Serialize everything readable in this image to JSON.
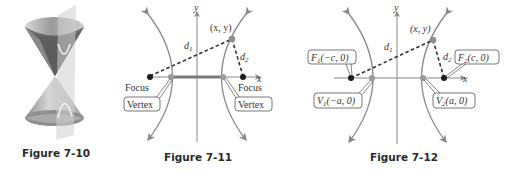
{
  "figures": [
    {
      "caption": "Figure 7-10",
      "description": "Double cone intersected by a vertical plane producing a hyperbola"
    },
    {
      "caption": "Figure 7-11",
      "labels": {
        "y_axis": "y",
        "x_axis": "x",
        "point": "(x, y)",
        "d1": "d",
        "d1_sub": "1",
        "d2": "d",
        "d2_sub": "2",
        "focus_left": "Focus",
        "focus_right": "Focus",
        "vertex_left": "Vertex",
        "vertex_right": "Vertex"
      }
    },
    {
      "caption": "Figure 7-12",
      "labels": {
        "y_axis": "y",
        "x_axis": "x",
        "point": "(x, y)",
        "d1": "d",
        "d1_sub": "1",
        "d2": "d",
        "d2_sub": "2",
        "f1": {
          "name": "F",
          "sub": "1",
          "coords": "(−c, 0)"
        },
        "f2": {
          "name": "F",
          "sub": "2",
          "coords": "(c, 0)"
        },
        "v1": {
          "name": "V",
          "sub": "1",
          "coords": "(−a, 0)"
        },
        "v2": {
          "name": "V",
          "sub": "2",
          "coords": "(a, 0)"
        }
      }
    }
  ],
  "colors": {
    "curve": "#8a8a8a",
    "focus_dot": "#1e1e1e",
    "vertex_dot": "#9a9a9a",
    "transverse_axis": "#7a7a7a"
  }
}
